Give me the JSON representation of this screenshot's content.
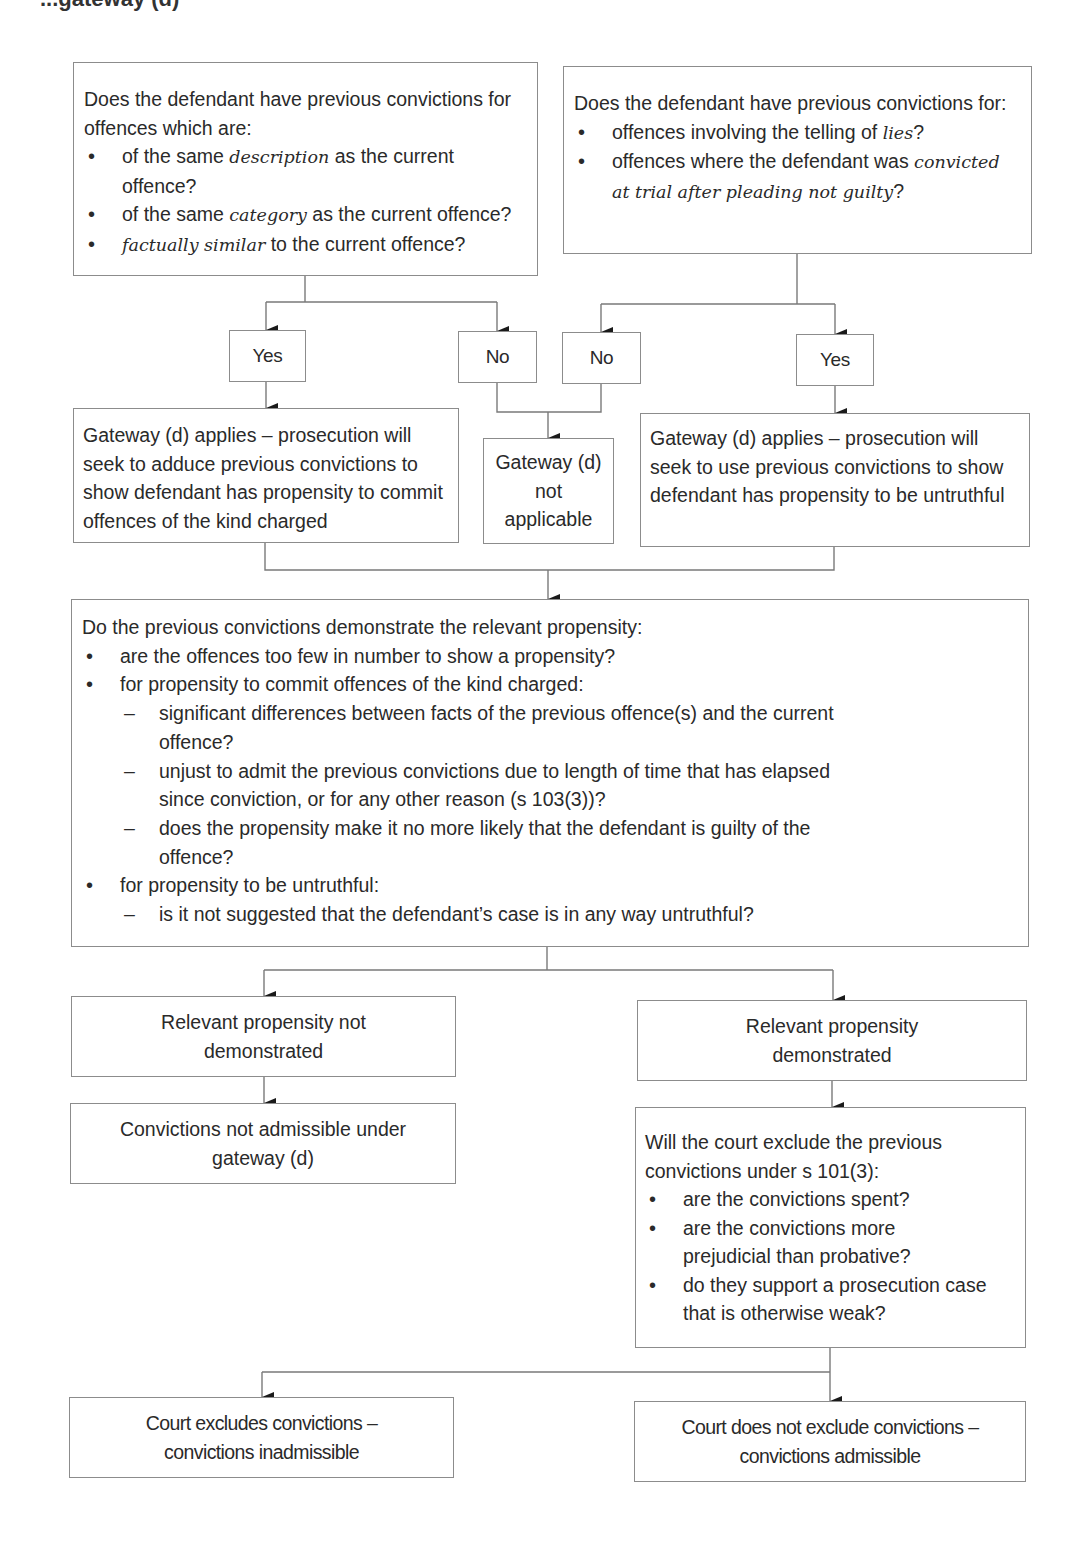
{
  "title": "...gateway (d)",
  "colors": {
    "border": "#8c8c8c",
    "text": "#2a2a2a",
    "arrow": "#1a1a1a",
    "background": "#ffffff"
  },
  "nodes": {
    "q_same_offence": {
      "intro": "Does the defendant have previous convictions for offences which are:",
      "bullets": [
        {
          "pre": "of the same ",
          "em": "description",
          "post": " as the current offence?"
        },
        {
          "pre": "of the same ",
          "em": "category",
          "post": " as the current offence?"
        },
        {
          "pre": "",
          "em": "factually similar",
          "post": " to the current offence?"
        }
      ]
    },
    "q_untruthful": {
      "intro": "Does the defendant have previous convictions for:",
      "bullets": [
        {
          "pre": "offences involving the telling of ",
          "em": "lies",
          "post": "?"
        },
        {
          "pre": "offences where the defendant was ",
          "em": "convicted at trial after pleading not guilty",
          "post": "?"
        }
      ]
    },
    "yes_left": "Yes",
    "no_left": "No",
    "no_right": "No",
    "yes_right": "Yes",
    "gateway_applies_kind": "Gateway (d) applies – prosecution will seek to adduce previous convictions to show defendant has propensity to commit offences of the kind charged",
    "gateway_not_applicable": [
      "Gateway (d)",
      "not",
      "applicable"
    ],
    "gateway_applies_untruthful": "Gateway (d) applies – prosecution will seek to use previous convictions to show defendant has propensity to be untruthful",
    "q_demonstrate": {
      "intro": "Do the previous convictions demonstrate the relevant propensity:",
      "bullet_1": "are the offences too few in number to show a propensity?",
      "bullet_2": "for propensity to commit offences of the kind charged:",
      "bullet_2_sub": [
        "significant differences between facts of the previous offence(s) and the current offence?",
        "unjust to admit the previous convictions due to length of time that has elapsed since conviction, or for any other reason (s 103(3))?",
        "does the propensity make it no more likely that the defendant is guilty of the offence?"
      ],
      "bullet_3": "for propensity to be untruthful:",
      "bullet_3_sub": [
        "is it not suggested that the defendant’s case is in any way untruthful?"
      ]
    },
    "not_demonstrated": "Relevant propensity not demonstrated",
    "demonstrated": "Relevant propensity demonstrated",
    "not_admissible_gateway": "Convictions not admissible under gateway (d)",
    "q_exclude": {
      "intro": "Will the court exclude the previous convictions under s 101(3):",
      "bullets": [
        "are the convictions spent?",
        "are the convictions more prejudicial than probative?",
        "do they support a prosecution case that is otherwise weak?"
      ]
    },
    "court_excludes": "Court excludes convictions – convictions inadmissible",
    "court_not_exclude": "Court does not exclude convictions – convictions admissible"
  }
}
